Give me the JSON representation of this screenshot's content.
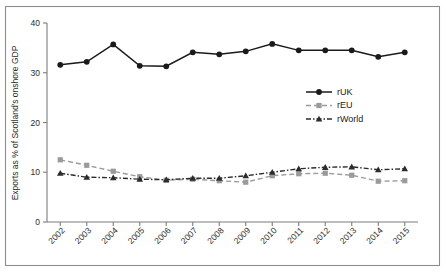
{
  "chart_data": {
    "type": "line",
    "title": "",
    "xlabel": "",
    "ylabel": "Exports as % of Scotland's onshore GDP",
    "categories": [
      "2002",
      "2003",
      "2004",
      "2005",
      "2006",
      "2007",
      "2008",
      "2009",
      "2010",
      "2011",
      "2012",
      "2013",
      "2014",
      "2015"
    ],
    "x": [
      2002,
      2003,
      2004,
      2005,
      2006,
      2007,
      2008,
      2009,
      2010,
      2011,
      2012,
      2013,
      2014,
      2015
    ],
    "ylim": [
      0,
      40
    ],
    "yticks": [
      0,
      10,
      20,
      30,
      40
    ],
    "ytick_labels": [
      "0",
      "10",
      "20",
      "30",
      "40"
    ],
    "grid": false,
    "legend_position": "center-right",
    "series": [
      {
        "name": "rUK",
        "color": "#1a1a1a",
        "marker": "circle",
        "dash": "none",
        "values": [
          31.6,
          32.2,
          35.7,
          31.4,
          31.3,
          34.1,
          33.7,
          34.3,
          35.8,
          34.5,
          34.5,
          34.5,
          33.2,
          34.1
        ]
      },
      {
        "name": "rEU",
        "color": "#9a9a9a",
        "marker": "square",
        "dash": "dashed",
        "values": [
          12.5,
          11.4,
          10.2,
          9.1,
          8.4,
          8.6,
          8.3,
          8.0,
          9.3,
          9.7,
          9.8,
          9.4,
          8.2,
          8.3
        ]
      },
      {
        "name": "rWorld",
        "color": "#2b2b2b",
        "marker": "triangle",
        "dash": "dashdot",
        "values": [
          9.8,
          9.0,
          8.9,
          8.6,
          8.5,
          8.8,
          8.8,
          9.3,
          10.0,
          10.7,
          11.0,
          11.1,
          10.5,
          10.7
        ]
      }
    ]
  },
  "legend": {
    "entries": [
      {
        "label": "rUK"
      },
      {
        "label": "rEU"
      },
      {
        "label": "rWorld"
      }
    ]
  }
}
